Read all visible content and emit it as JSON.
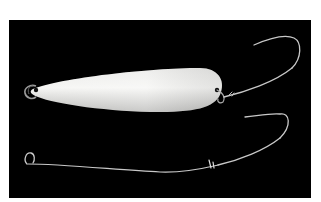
{
  "image": {
    "subject": "spoon fishing lure with hooks",
    "colors": {
      "margin": "#ffffff",
      "backdrop": "#000000",
      "lure_body": "#f2f2f0",
      "lure_shade": "#bdbdbb",
      "wire": "#c8c8c8"
    },
    "objects": [
      {
        "name": "spoon-lure",
        "label": "White spoon lure body"
      },
      {
        "name": "split-ring-front",
        "label": "Split ring at lure nose"
      },
      {
        "name": "upper-hook",
        "label": "Single hook attached to lure tail"
      },
      {
        "name": "lower-hook-rig",
        "label": "Wire leader with loop and hook"
      }
    ]
  }
}
